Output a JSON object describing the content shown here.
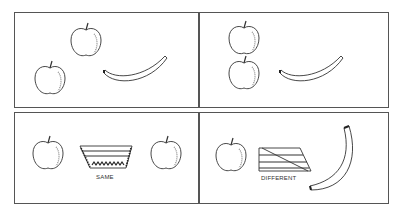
{
  "figure": {
    "panels": [
      {
        "id": "top-left",
        "contents": [
          "apple",
          "apple",
          "banana"
        ]
      },
      {
        "id": "top-right",
        "contents": [
          "apple",
          "apple",
          "banana"
        ]
      },
      {
        "id": "bottom-left",
        "contents": [
          "apple",
          "same-symbol",
          "apple"
        ],
        "label": "SAME"
      },
      {
        "id": "bottom-right",
        "contents": [
          "apple",
          "different-symbol",
          "banana"
        ],
        "label": "DIFFERENT"
      }
    ],
    "colors": {
      "line": "#333333",
      "border": "#555555",
      "background": "#ffffff"
    }
  }
}
